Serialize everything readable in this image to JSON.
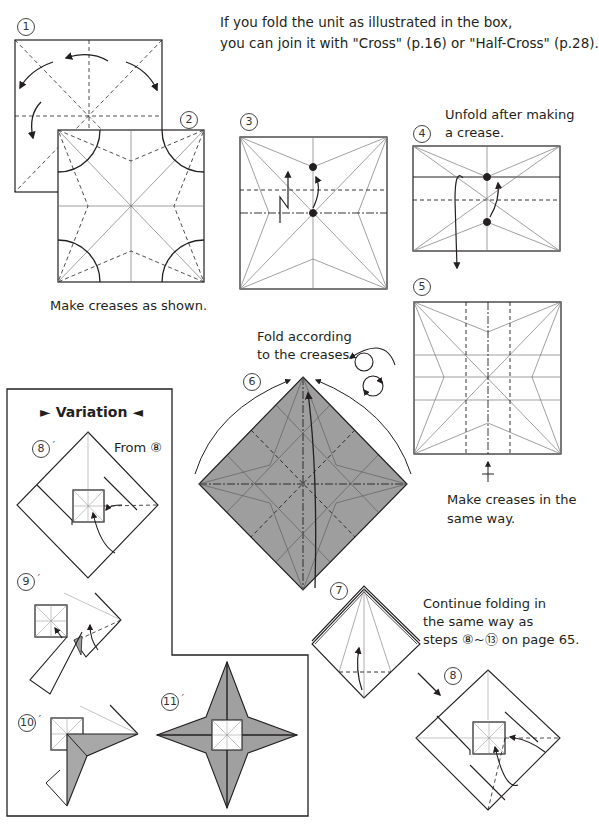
{
  "page": {
    "intro": {
      "line1": "If you fold the unit as illustrated in the box,",
      "line2": "you can join it with \"Cross\" (p.16) or \"Half-Cross\" (p.28)."
    },
    "steps": [
      {
        "id": "1",
        "label": "1"
      },
      {
        "id": "2",
        "label": "2",
        "caption": "Make creases as shown."
      },
      {
        "id": "3",
        "label": "3"
      },
      {
        "id": "4",
        "label": "4",
        "caption_line1": "Unfold after making",
        "caption_line2": "a crease."
      },
      {
        "id": "5",
        "label": "5",
        "caption_line1": "Make creases in the",
        "caption_line2": "same way."
      },
      {
        "id": "6",
        "label": "6",
        "caption_line1": "Fold according",
        "caption_line2": "to the creases."
      },
      {
        "id": "7",
        "label": "7",
        "caption_line1": "Continue folding in",
        "caption_line2": "the same way as",
        "caption_line3": "steps ⑧~⑬ on page 65."
      },
      {
        "id": "8",
        "label": "8"
      }
    ],
    "variation": {
      "title": "► Variation ◄",
      "steps": [
        {
          "id": "8p",
          "label": "8",
          "note": "From ⑧"
        },
        {
          "id": "9p",
          "label": "9"
        },
        {
          "id": "10p",
          "label": "10"
        },
        {
          "id": "11p",
          "label": "11"
        }
      ]
    },
    "colors": {
      "paper_colored": "#9e9e9e",
      "paper_colored_light": "#b3b3b3",
      "line": "#231f20",
      "crease": "#6d6d6d"
    }
  }
}
